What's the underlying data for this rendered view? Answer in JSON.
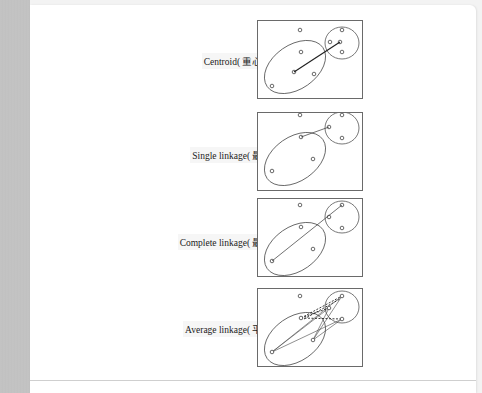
{
  "diagram": {
    "panels": [
      {
        "id": "centroid",
        "label": "Centroid( 重心法 )",
        "method": "Centroid",
        "method_zh": "重心法"
      },
      {
        "id": "single",
        "label": "Single linkage( 最近 )",
        "method": "Single linkage",
        "method_zh": "最近"
      },
      {
        "id": "complete",
        "label": "Complete linkage( 最遠 )",
        "method": "Complete linkage",
        "method_zh": "最遠"
      },
      {
        "id": "average",
        "label": "Average linkage( 平均 )",
        "method": "Average linkage",
        "method_zh": "平均"
      }
    ],
    "points": {
      "outlier": [
        42,
        9
      ],
      "cluster_a": [
        [
          14,
          79
        ],
        [
          43,
          32
        ],
        [
          59,
          62
        ]
      ],
      "cluster_b": [
        [
          84,
          36
        ],
        [
          93,
          31
        ],
        [
          97,
          21
        ]
      ],
      "cluster_b_extra": [
        [
          83,
          9
        ],
        [
          96,
          42
        ]
      ]
    },
    "colors": {
      "frame": "#6a6a6a",
      "ellipse": "#555555",
      "point": "#444444",
      "link": "#222222",
      "page_bg": "#f3f3f3",
      "left_strip": "#c2c2c2"
    }
  }
}
